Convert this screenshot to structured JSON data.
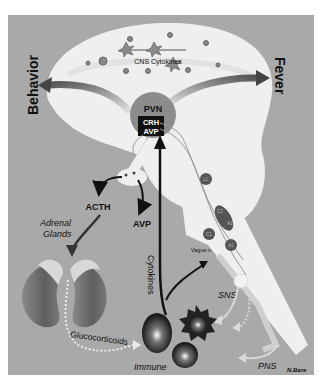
{
  "figure": {
    "colors": {
      "background": "#a9a9a9",
      "brain": "#efefef",
      "dark_cell": "#222222",
      "arrow": "#111111"
    },
    "labels": {
      "cns_cytokines": "CNS Cytokines",
      "behavior": "Behavior",
      "fever": "Fever",
      "pvn": "PVN",
      "crh": "CRH",
      "avp_box": "AVP",
      "acth": "ACTH",
      "avp": "AVP",
      "adrenal_line1": "Adrenal",
      "adrenal_line2": "Glands",
      "glucocorticoids": "Glucocorticoids",
      "cytokines": "Cytokines",
      "vagus": "Vagus n.",
      "sns": "SNS",
      "pns": "PNS",
      "immune_line1": "Immune",
      "immune_line2": "System",
      "signature": "N.Bare",
      "lc": "LC",
      "c2": "C2",
      "a2": "A2",
      "c1": "C1",
      "a1": "A1"
    }
  }
}
